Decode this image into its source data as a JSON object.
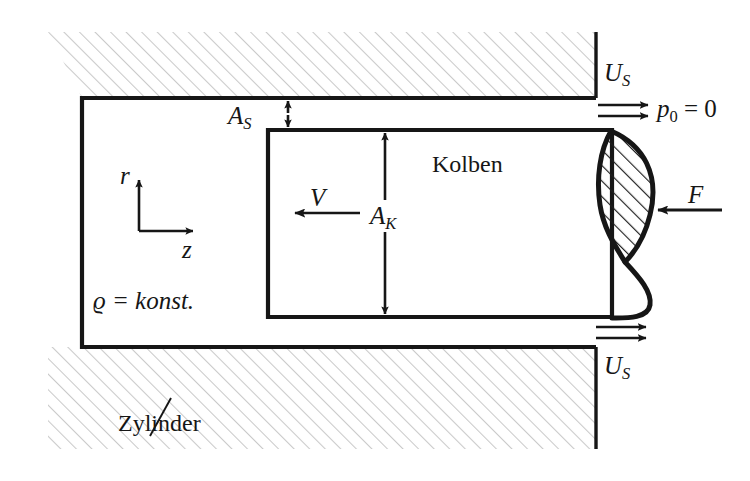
{
  "figure": {
    "colors": {
      "line": "#161616",
      "wall_hatch": "#c9c9c9",
      "piston_head_hatch": "#1a1a1a",
      "background": "#ffffff"
    }
  },
  "labels": {
    "piston": "Kolben",
    "cylinder": "Zylinder",
    "density": "ϱ = konst.",
    "pressure": "p",
    "pressure_sub": "0",
    "pressure_value": " = 0",
    "force": "F",
    "piston_velocity": "V",
    "gap_area": "A",
    "gap_area_sub": "S",
    "piston_area": "A",
    "piston_area_sub": "K",
    "gap_velocity_top": "U",
    "gap_velocity_top_sub": "S",
    "gap_velocity_bottom": "U",
    "gap_velocity_bottom_sub": "S",
    "axis_r": "r",
    "axis_z": "z"
  },
  "icons": {
    "coordinate_axes": "axes-icon",
    "flow_arrows_top": "flow-arrow-icon",
    "flow_arrows_bottom": "flow-arrow-icon",
    "force_arrow": "arrow-left-icon",
    "velocity_arrow": "arrow-left-icon",
    "dimension_as": "dimension-arrow-icon",
    "dimension_ak": "dimension-arrow-icon",
    "leader_line": "leader-line-icon"
  }
}
